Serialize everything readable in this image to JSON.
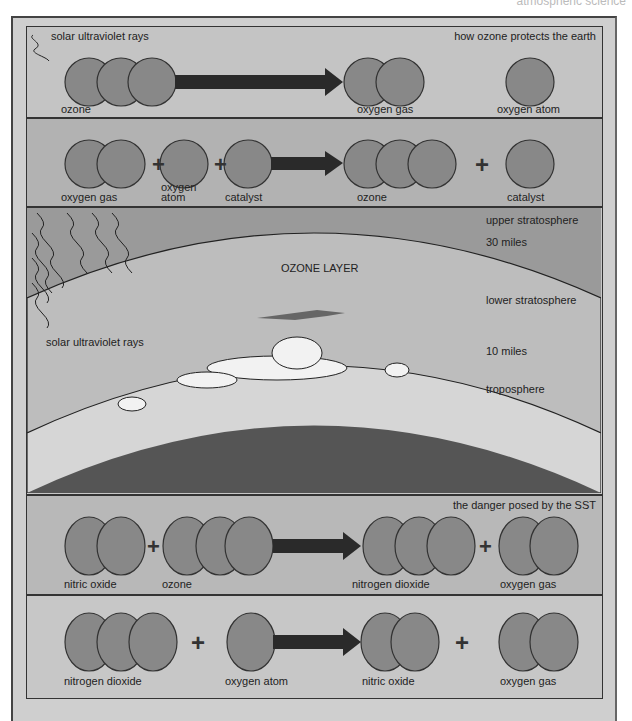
{
  "header": {
    "text": "atmospheric science"
  },
  "panel_protects": {
    "title": "how ozone protects the earth",
    "uv_label": "solar ultraviolet rays",
    "labels": {
      "reactant": "ozone",
      "product1": "oxygen gas",
      "product2": "oxygen atom"
    }
  },
  "panel_formation": {
    "labels": {
      "r1": "oxygen gas",
      "r2_line1": "oxygen",
      "r2_line2": "atom",
      "r3": "catalyst",
      "p1": "ozone",
      "p2": "catalyst"
    },
    "plus": "+"
  },
  "atmosphere": {
    "ozone_layer": "OZONE LAYER",
    "upper": "upper stratosphere",
    "alt30": "30 miles",
    "lower": "lower stratosphere",
    "alt10": "10 miles",
    "tropo": "troposphere",
    "uv_label": "solar ultraviolet rays"
  },
  "panel_sst": {
    "title": "the danger posed by the SST",
    "labels": {
      "r1": "nitric oxide",
      "r2": "ozone",
      "p1": "nitrogen dioxide",
      "p2": "oxygen gas"
    },
    "plus": "+"
  },
  "panel_regen": {
    "labels": {
      "r1": "nitrogen dioxide",
      "r2": "oxygen atom",
      "p1": "nitric oxide",
      "p2": "oxygen gas"
    },
    "plus": "+"
  },
  "colors": {
    "atom": "#888888",
    "arrow": "#2a2a2a",
    "earth": "#555555",
    "upper": "#9a9a9a",
    "ozone": "#bdbdbd",
    "tropo": "#d6d6d6"
  }
}
